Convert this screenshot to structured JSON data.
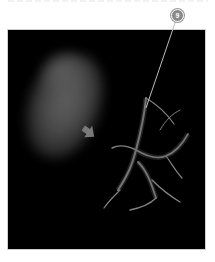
{
  "figure": {
    "panel_background": "#000000",
    "callout": {
      "number": "9",
      "badge_color": "#8a8a8a",
      "line_color": "#bdbdbd"
    },
    "arrow": {
      "icon": "arrow-down-right-icon",
      "color": "#7a7a7a"
    },
    "regions": [
      {
        "name": "diffuse-glow",
        "color": "#5a5a5a"
      },
      {
        "name": "branching-vessels",
        "color": "#9a9a9a"
      }
    ]
  }
}
